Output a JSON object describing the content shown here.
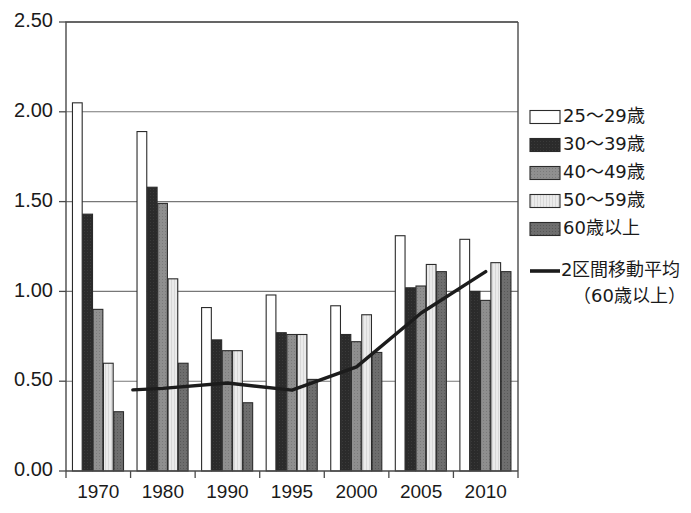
{
  "chart_data": {
    "type": "bar",
    "title": "",
    "subtitle": "",
    "xlabel": "",
    "ylabel": "",
    "categories": [
      "1970",
      "1980",
      "1990",
      "1995",
      "2000",
      "2005",
      "2010"
    ],
    "ylim": [
      0.0,
      2.5
    ],
    "ytick_labels": [
      "0.00",
      "0.50",
      "1.00",
      "1.50",
      "2.00",
      "2.50"
    ],
    "ytick_values": [
      0.0,
      0.5,
      1.0,
      1.5,
      2.0,
      2.5
    ],
    "grid": "horizontal",
    "legend_position": "right",
    "series": [
      {
        "name": "25〜29歳",
        "fill": "#ffffff",
        "values": [
          2.05,
          1.89,
          0.91,
          0.98,
          0.92,
          1.31,
          1.29
        ]
      },
      {
        "name": "30〜39歳",
        "fill": "#2b2b2b",
        "values": [
          1.43,
          1.58,
          0.73,
          0.77,
          0.76,
          1.02,
          1.0
        ]
      },
      {
        "name": "40〜49歳",
        "fill": "#8f8f8f",
        "values": [
          0.9,
          1.49,
          0.67,
          0.76,
          0.72,
          1.03,
          0.95
        ]
      },
      {
        "name": "50〜59歳",
        "fill": "#ebebeb",
        "values": [
          0.6,
          1.07,
          0.67,
          0.76,
          0.87,
          1.15,
          1.16
        ]
      },
      {
        "name": "60歳以上",
        "fill": "#6e6e6e",
        "values": [
          0.33,
          0.6,
          0.38,
          0.51,
          0.66,
          1.11,
          1.11
        ]
      }
    ],
    "line_series": {
      "name": "2区間移動平均（60歳以上）",
      "name_line1": "2区間移動平均",
      "name_line2": "（60歳以上）",
      "color": "#1c1c1c",
      "x": [
        "1980",
        "1990",
        "1995",
        "2000",
        "2005",
        "2010"
      ],
      "values": [
        0.46,
        0.49,
        0.45,
        0.58,
        0.88,
        1.11
      ]
    }
  },
  "legend": {
    "items": [
      {
        "label": "25〜29歳",
        "swatch": "#ffffff",
        "type": "bar"
      },
      {
        "label": "30〜39歳",
        "swatch": "#2b2b2b",
        "type": "bar"
      },
      {
        "label": "40〜49歳",
        "swatch": "#8f8f8f",
        "type": "bar"
      },
      {
        "label": "50〜59歳",
        "swatch": "#ebebeb",
        "type": "bar"
      },
      {
        "label": "60歳以上",
        "swatch": "#6e6e6e",
        "type": "bar"
      },
      {
        "label_line1": "2区間移動平均",
        "label_line2": "（60歳以上）",
        "swatch": "#1c1c1c",
        "type": "line"
      }
    ]
  },
  "axes": {
    "y_labels": [
      "2.50",
      "2.00",
      "1.50",
      "1.00",
      "0.50",
      "0.00"
    ],
    "x_labels": [
      "1970",
      "1980",
      "1990",
      "1995",
      "2000",
      "2005",
      "2010"
    ]
  }
}
